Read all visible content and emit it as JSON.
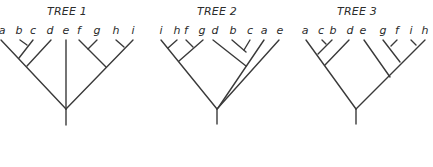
{
  "diagram": {
    "type": "phylogenetic-trees",
    "colors": {
      "line": "#3a3a3a",
      "text": "#2b2b2b",
      "background": "#ffffff"
    },
    "trees": [
      {
        "id": "tree-1",
        "title": "TREE 1",
        "title_pos": [
          67,
          15
        ],
        "leaf_order": [
          "a",
          "b",
          "c",
          "d",
          "e",
          "f",
          "g",
          "h",
          "i"
        ],
        "leaves": [
          {
            "label": "a",
            "x": 2,
            "y": 34
          },
          {
            "label": "b",
            "x": 19,
            "y": 34
          },
          {
            "label": "c",
            "x": 33,
            "y": 34
          },
          {
            "label": "d",
            "x": 50,
            "y": 34
          },
          {
            "label": "e",
            "x": 66,
            "y": 34
          },
          {
            "label": "f",
            "x": 79,
            "y": 34
          },
          {
            "label": "g",
            "x": 97,
            "y": 34
          },
          {
            "label": "h",
            "x": 116,
            "y": 34
          },
          {
            "label": "i",
            "x": 133,
            "y": 34
          }
        ],
        "branches": [
          [
            1,
            40,
            66,
            109
          ],
          [
            20,
            40,
            27,
            45
          ],
          [
            33,
            40,
            19,
            58
          ],
          [
            51,
            40,
            27,
            66
          ],
          [
            66,
            40,
            66,
            109
          ],
          [
            79,
            40,
            106,
            67
          ],
          [
            97,
            40,
            88,
            49
          ],
          [
            116,
            40,
            124,
            47
          ],
          [
            133,
            40,
            66,
            109
          ],
          [
            66,
            109,
            66,
            125
          ]
        ],
        "newick": "((((b,c),a),d),e,((f,g),(h,i)))"
      },
      {
        "id": "tree-2",
        "title": "TREE 2",
        "title_pos": [
          217,
          15
        ],
        "leaf_order": [
          "i",
          "h",
          "f",
          "g",
          "d",
          "b",
          "c",
          "a",
          "e"
        ],
        "leaves": [
          {
            "label": "i",
            "x": 161,
            "y": 34
          },
          {
            "label": "h",
            "x": 177,
            "y": 34
          },
          {
            "label": "f",
            "x": 186,
            "y": 34
          },
          {
            "label": "g",
            "x": 202,
            "y": 34
          },
          {
            "label": "d",
            "x": 215,
            "y": 34
          },
          {
            "label": "b",
            "x": 233,
            "y": 34
          },
          {
            "label": "c",
            "x": 250,
            "y": 34
          },
          {
            "label": "a",
            "x": 264,
            "y": 34
          },
          {
            "label": "e",
            "x": 280,
            "y": 34
          }
        ],
        "branches": [
          [
            161,
            40,
            217,
            109
          ],
          [
            177,
            40,
            168,
            48
          ],
          [
            186,
            40,
            193,
            47
          ],
          [
            203,
            40,
            179,
            61
          ],
          [
            213,
            40,
            246,
            66
          ],
          [
            232,
            40,
            246,
            52
          ],
          [
            250,
            40,
            244,
            50
          ],
          [
            264,
            40,
            218,
            108
          ],
          [
            279,
            40,
            217,
            109
          ],
          [
            217,
            109,
            217,
            124
          ]
        ],
        "newick": "(((i,(h,f)),g),(((d,(b,c)),a),e))"
      },
      {
        "id": "tree-3",
        "title": "TREE 3",
        "title_pos": [
          357,
          15
        ],
        "leaf_order": [
          "a",
          "c",
          "b",
          "d",
          "e",
          "g",
          "f",
          "i",
          "h"
        ],
        "leaves": [
          {
            "label": "a",
            "x": 305,
            "y": 34
          },
          {
            "label": "c",
            "x": 321,
            "y": 34
          },
          {
            "label": "b",
            "x": 333,
            "y": 34
          },
          {
            "label": "d",
            "x": 350,
            "y": 34
          },
          {
            "label": "e",
            "x": 363,
            "y": 34
          },
          {
            "label": "g",
            "x": 383,
            "y": 34
          },
          {
            "label": "f",
            "x": 397,
            "y": 34
          },
          {
            "label": "i",
            "x": 411,
            "y": 34
          },
          {
            "label": "h",
            "x": 425,
            "y": 34
          }
        ],
        "branches": [
          [
            306,
            40,
            356,
            109
          ],
          [
            322,
            40,
            326,
            44
          ],
          [
            332,
            40,
            318,
            54
          ],
          [
            349,
            40,
            325,
            65
          ],
          [
            364,
            40,
            390,
            77
          ],
          [
            383,
            40,
            400,
            62
          ],
          [
            397,
            40,
            391,
            46
          ],
          [
            411,
            40,
            416,
            45
          ],
          [
            425,
            40,
            356,
            109
          ],
          [
            356,
            109,
            356,
            124
          ]
        ],
        "newick": "((((a,(c,b)),d)),(e,((g,f),(i,h))))"
      }
    ]
  }
}
